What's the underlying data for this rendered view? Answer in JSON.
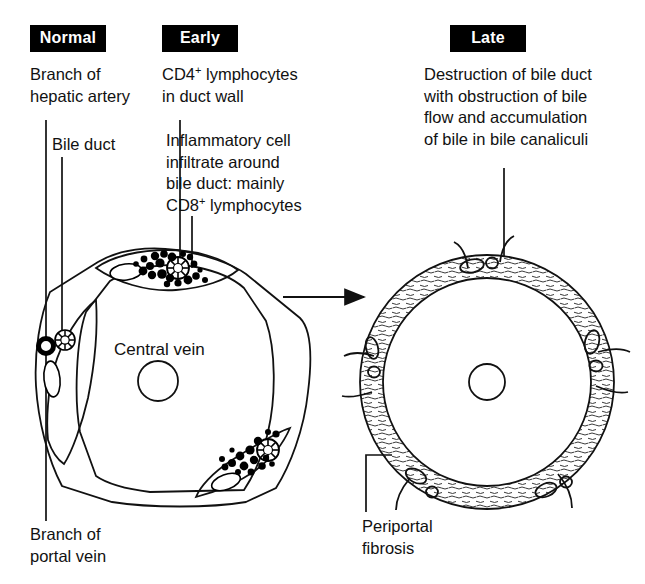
{
  "figure": {
    "title_caption": "Stages of bile duct damage in primary biliary cholangitis",
    "background_color": "#ffffff",
    "ink_color": "#000000"
  },
  "stages": [
    {
      "id": "normal",
      "label": "Normal",
      "x": 30,
      "y": 25,
      "w": 76,
      "h": 27
    },
    {
      "id": "early",
      "label": "Early",
      "x": 162,
      "y": 25,
      "w": 76,
      "h": 27
    },
    {
      "id": "late",
      "label": "Late",
      "x": 450,
      "y": 25,
      "w": 76,
      "h": 27
    }
  ],
  "callouts": {
    "hepatic_artery": {
      "text": "Branch of\nhepatic artery",
      "x": 30,
      "y": 64,
      "leader": {
        "type": "vertical",
        "x": 46,
        "y1": 120,
        "y2": 521
      }
    },
    "bile_duct": {
      "text": "Bile duct",
      "x": 52,
      "y": 134,
      "leader": {
        "type": "vertical",
        "x": 62,
        "y1": 157,
        "y2": 343
      }
    },
    "cd4": {
      "text_parts": [
        "CD4",
        "+",
        " lymphocytes\nin duct wall"
      ],
      "text": "CD4+ lymphocytes in duct wall",
      "x": 162,
      "y": 64,
      "leader": {
        "type": "vertical",
        "x": 180,
        "y1": 120,
        "y2": 262
      }
    },
    "cd8": {
      "text_parts": [
        "Inflammatory cell\ninfiltrate around\nbile duct: mainly\nCD8",
        "+",
        " lymphocytes"
      ],
      "text": "Inflammatory cell infiltrate around bile duct: mainly CD8+ lymphocytes",
      "x": 166,
      "y": 130,
      "leader": {
        "type": "vertical",
        "x": 192,
        "y1": 216,
        "y2": 268
      }
    },
    "portal_vein": {
      "text": "Branch of\nportal vein",
      "x": 30,
      "y": 524,
      "leader": {
        "type": "vertical",
        "x": 46,
        "y1": 490,
        "y2": 521
      }
    },
    "destruction": {
      "text": "Destruction of bile duct\nwith obstruction of bile\nflow and accumulation\nof bile in bile canaliculi",
      "x": 424,
      "y": 64,
      "leader": {
        "type": "vertical",
        "x": 504,
        "y1": 168,
        "y2": 256
      }
    },
    "periportal_fibrosis": {
      "text": "Periportal\nfibrosis",
      "x": 362,
      "y": 516,
      "leader": {
        "type": "elbow",
        "x1": 366,
        "y1": 455,
        "x2": 392,
        "y2": 455,
        "y3": 512
      }
    }
  },
  "left_diagram": {
    "name": "hepatic-lobule-normal-early",
    "central_vein_label": "Central vein",
    "central_vein_label_x": 114,
    "central_vein_label_y": 340,
    "central_vein": {
      "cx": 158,
      "cy": 381,
      "r": 20
    },
    "portal_tracts": [
      {
        "id": "left-normal",
        "inflamed": false,
        "structures": [
          "hepatic-artery",
          "bile-duct",
          "portal-vein"
        ]
      },
      {
        "id": "top-inflamed",
        "inflamed": true,
        "structures": [
          "bile-duct",
          "portal-vein",
          "lymphocytes"
        ]
      },
      {
        "id": "bottom-right-inflamed",
        "inflamed": true,
        "structures": [
          "bile-duct",
          "portal-vein",
          "lymphocytes"
        ]
      }
    ]
  },
  "right_diagram": {
    "name": "hepatic-lobule-late-fibrosis",
    "central_vein": {
      "cx": 487,
      "cy": 382,
      "r": 18
    },
    "fibrotic_ring": {
      "cx": 487,
      "cy": 382,
      "r_outer": 128,
      "r_inner": 104
    }
  },
  "arrow": {
    "name": "progression-arrow",
    "x1": 283,
    "y1": 297,
    "x2": 366,
    "y2": 297
  }
}
